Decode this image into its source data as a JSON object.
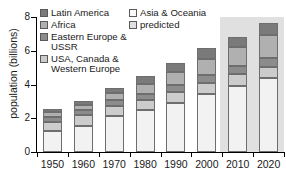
{
  "chart_data": {
    "type": "bar",
    "subtype": "stacked-bar",
    "title": "",
    "xlabel": "",
    "ylabel": "population (billions)",
    "categories": [
      "1950",
      "1960",
      "1970",
      "1980",
      "1990",
      "2000",
      "2010",
      "2020"
    ],
    "ylim": [
      0,
      8
    ],
    "yticks": [
      0,
      2,
      4,
      6,
      8
    ],
    "ytick_labels": [
      "0",
      "2",
      "4",
      "6",
      "8"
    ],
    "grid": false,
    "legend_position": "top-left-inside",
    "series": [
      {
        "name": "Asia & Oceania",
        "color": "#f2f2f2",
        "values": [
          1.25,
          1.55,
          2.15,
          2.5,
          2.9,
          3.45,
          3.9,
          4.4
        ]
      },
      {
        "name": "USA, Canada & Western Europe",
        "color": "#cccccc",
        "values": [
          0.55,
          0.65,
          0.6,
          0.6,
          0.65,
          0.65,
          0.7,
          0.65
        ]
      },
      {
        "name": "Eastern Europe & USSR",
        "color": "#8c8c8c",
        "values": [
          0.3,
          0.3,
          0.35,
          0.35,
          0.45,
          0.45,
          0.5,
          0.5
        ]
      },
      {
        "name": "Africa",
        "color": "#b0b0b0",
        "values": [
          0.25,
          0.3,
          0.4,
          0.6,
          0.75,
          0.95,
          1.1,
          1.4
        ]
      },
      {
        "name": "Latin America",
        "color": "#7a7a7a",
        "values": [
          0.2,
          0.25,
          0.3,
          0.45,
          0.5,
          0.65,
          0.6,
          0.7
        ]
      }
    ],
    "totals": [
      2.55,
      3.05,
      3.8,
      4.5,
      5.25,
      6.15,
      6.8,
      7.65
    ],
    "annotations": {
      "predicted_region": {
        "label": "predicted",
        "categories": [
          "2010",
          "2020"
        ],
        "color": "#e0e0e0"
      }
    }
  },
  "legend": {
    "left_column": [
      {
        "label": "Latin America",
        "color": "#7a7a7a"
      },
      {
        "label": "Africa",
        "color": "#b0b0b0"
      },
      {
        "label": "Eastern Europe & USSR",
        "color": "#8c8c8c"
      },
      {
        "label": "USA, Canada & Western Europe",
        "color": "#cccccc"
      }
    ],
    "right_column": [
      {
        "label": "Asia & Oceania",
        "color": "#fbfbfb"
      },
      {
        "label": "predicted",
        "color": "#e0e0e0"
      }
    ]
  },
  "axes": {
    "y_title": "population (billions)",
    "y_tick_labels": [
      "8",
      "6",
      "4",
      "2",
      "0"
    ],
    "x_tick_labels": [
      "1950",
      "1960",
      "1970",
      "1980",
      "1990",
      "2000",
      "2010",
      "2020"
    ]
  }
}
